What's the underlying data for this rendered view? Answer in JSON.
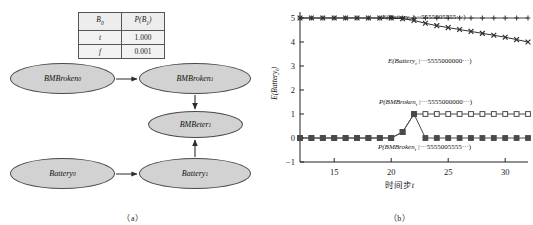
{
  "figure": {
    "panel_a_caption": "（a）",
    "panel_b_caption": "（b）"
  },
  "cpt_table": {
    "headers": [
      "B",
      "P(B)"
    ],
    "header_subs": [
      "0",
      "1"
    ],
    "rows": [
      {
        "condition": "t",
        "probability": "1.000"
      },
      {
        "condition": "f",
        "probability": "0.001"
      }
    ]
  },
  "dbn_graph": {
    "nodes": [
      {
        "id": "bmbroken0",
        "label": "BMBroken",
        "sub": "0"
      },
      {
        "id": "bmbroken1",
        "label": "BMBroken",
        "sub": "1"
      },
      {
        "id": "bmbeter1",
        "label": "BMBeter",
        "sub": "1"
      },
      {
        "id": "battery0",
        "label": "Battery",
        "sub": "0"
      },
      {
        "id": "battery1",
        "label": "Battery",
        "sub": "1"
      }
    ],
    "edges": [
      {
        "from": "bmbroken0",
        "to": "bmbroken1"
      },
      {
        "from": "bmbroken1",
        "to": "bmbeter1"
      },
      {
        "from": "battery0",
        "to": "battery1"
      },
      {
        "from": "battery1",
        "to": "bmbeter1"
      }
    ]
  },
  "chart_data": {
    "type": "line",
    "title": "",
    "xlabel_cn": "时间步",
    "xlabel_var": "t",
    "ylabel": "E(Battery",
    "ylabel_sub": "t",
    "ylabel_tail": ")",
    "xlim": [
      12,
      32
    ],
    "ylim": [
      -1,
      5
    ],
    "xticks": [
      15,
      20,
      25,
      30
    ],
    "yticks": [
      -1,
      0,
      1,
      2,
      3,
      4,
      5
    ],
    "grid": false,
    "legend_position": "inline-annotations",
    "x": [
      12,
      13,
      14,
      15,
      16,
      17,
      18,
      19,
      20,
      21,
      22,
      23,
      24,
      25,
      26,
      27,
      28,
      29,
      30,
      31,
      32
    ],
    "series": [
      {
        "name": "E(Battery_t | ...5555005555...)",
        "label_main": "E(Battery",
        "label_sub": "t",
        "label_tail": " |",
        "label_obs": "···5555005555···)",
        "marker": "plus",
        "color": "#404040",
        "values": [
          5,
          5,
          5,
          5,
          5,
          5,
          5,
          5,
          5,
          5,
          5,
          5,
          5,
          5,
          5,
          5,
          5,
          5,
          5,
          5,
          5
        ]
      },
      {
        "name": "E(Battery_t | ...5555000000...)",
        "label_main": "E(Battery",
        "label_sub": "t",
        "label_tail": " |",
        "label_obs": "···5555000000···)",
        "marker": "x",
        "color": "#303030",
        "values": [
          5,
          5,
          5,
          5,
          5,
          5,
          5,
          5,
          5,
          4.97,
          4.9,
          4.78,
          4.68,
          4.6,
          4.52,
          4.44,
          4.36,
          4.28,
          4.2,
          4.1,
          4.0
        ]
      },
      {
        "name": "P(BMBroken_t | ...5555000000...)",
        "label_main": "P(BMBroken",
        "label_sub": "t",
        "label_tail": " |",
        "label_obs": "···5555000000···)",
        "marker": "square-open",
        "color": "#4a4a4a",
        "values": [
          0,
          0,
          0,
          0,
          0,
          0,
          0,
          0,
          0,
          0.25,
          1,
          1,
          1,
          1,
          1,
          1,
          1,
          1,
          1,
          1,
          1
        ]
      },
      {
        "name": "P(BMBroken_t | ...5555005555...)",
        "label_main": "P(BMBroken",
        "label_sub": "t",
        "label_tail": " |",
        "label_obs": "···5555005555···)",
        "marker": "square-filled",
        "color": "#4a4a4a",
        "values": [
          0,
          0,
          0,
          0,
          0,
          0,
          0,
          0,
          0,
          0.25,
          1,
          0,
          0,
          0,
          0,
          0,
          0,
          0,
          0,
          0,
          0
        ]
      }
    ],
    "annotations": [
      {
        "text": "E(Battery_t |···5555005555···)",
        "x": 24.5,
        "y": 5.45
      },
      {
        "text": "E(Battery_t |···5555000000···)",
        "x": 25.0,
        "y": 3.45
      },
      {
        "text": "P(BMBroken_t |···5555000000···)",
        "x": 25.5,
        "y": 1.75
      },
      {
        "text": "P(BMBroken_t |···5555005555···)",
        "x": 25.5,
        "y": -0.55
      }
    ]
  }
}
